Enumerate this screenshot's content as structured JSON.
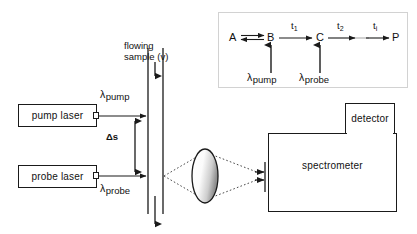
{
  "figure": {
    "type": "optical-setup-schematic"
  },
  "instruments": {
    "pump_laser": "pump  laser",
    "probe_laser": "probe  laser",
    "spectrometer": "spectrometer",
    "detector": "detector"
  },
  "labels": {
    "flowing_sample_line1": "flowing",
    "flowing_sample_line2": "sample (v)",
    "delta_s": "Δs",
    "lambda_char": "λ",
    "pump_sub": "pump",
    "probe_sub": "probe"
  },
  "inset": {
    "species": [
      "A",
      "B",
      "C",
      "P"
    ],
    "time_labels": [
      {
        "base": "t",
        "sub": "1"
      },
      {
        "base": "t",
        "sub": "2"
      },
      {
        "base": "t",
        "sub": "i"
      }
    ],
    "excitation": [
      {
        "lambda": "λ",
        "sub": "pump"
      },
      {
        "lambda": "λ",
        "sub": "probe"
      }
    ],
    "scheme": "A ⇌ B →(t1) C →(t2) … →(ti) P"
  },
  "colors": {
    "stroke": "#1a1a1a",
    "inset_border": "#d2d2d2",
    "beam_dotted": "#555555",
    "lens_fill_light": "#ffffff",
    "lens_fill_dark": "#9a9a9a",
    "background": "#ffffff"
  }
}
